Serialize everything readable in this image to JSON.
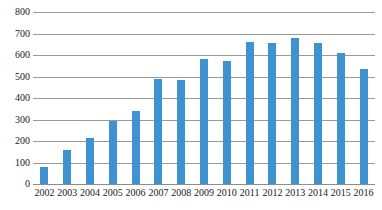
{
  "chart_data": {
    "type": "bar",
    "title": "",
    "subtitle": "",
    "xlabel": "",
    "ylabel": "",
    "categories": [
      "2002",
      "2003",
      "2004",
      "2005",
      "2006",
      "2007",
      "2008",
      "2009",
      "2010",
      "2011",
      "2012",
      "2013",
      "2014",
      "2015",
      "2016"
    ],
    "values": [
      80,
      160,
      215,
      295,
      340,
      490,
      485,
      580,
      570,
      660,
      655,
      680,
      655,
      610,
      535
    ],
    "ylim": [
      0,
      800
    ],
    "y_ticks": [
      0,
      100,
      200,
      300,
      400,
      500,
      600,
      700,
      800
    ],
    "y_tick_labels": [
      "0",
      "100",
      "200",
      "300",
      "400",
      "500",
      "600",
      "700",
      "800"
    ],
    "grid": true,
    "grid_axis": "y",
    "legend": false,
    "legend_position": "none",
    "series": [
      {
        "name": "",
        "color": "#3e92d0",
        "values": [
          80,
          160,
          215,
          295,
          340,
          490,
          485,
          580,
          570,
          660,
          655,
          680,
          655,
          610,
          535
        ]
      }
    ],
    "annotations": []
  },
  "style": {
    "bar_color": "#3e92d0",
    "gridline_color": "#9a9a9a",
    "axis_color": "#8d8d8d",
    "label_color": "#1a1a1a",
    "background": "#ffffff"
  }
}
